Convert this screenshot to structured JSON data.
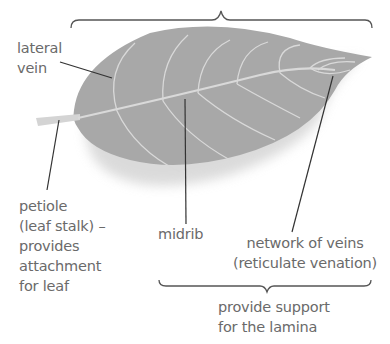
{
  "diagram": {
    "colors": {
      "leaf": "#a8a8a8",
      "vein": "#d9d9d9",
      "shadow": "#e0e0e0",
      "label_text": "#6a6a6a",
      "leader_line": "#333333",
      "brace": "#555555"
    },
    "labels": {
      "lateral_vein": [
        "lateral",
        "vein"
      ],
      "petiole": [
        "petiole",
        "(leaf stalk) –",
        "provides",
        "attachment",
        "for leaf"
      ],
      "midrib": "midrib",
      "network_of_veins": [
        "network of veins",
        "(reticulate venation)"
      ],
      "support": [
        "provide support",
        "for the lamina"
      ]
    }
  }
}
